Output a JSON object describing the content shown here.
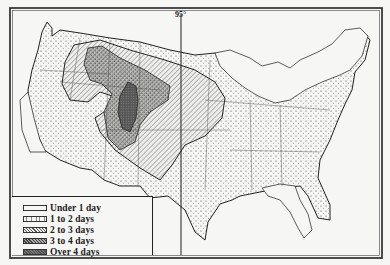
{
  "map": {
    "subject": "United States",
    "meridian_label": "95°",
    "legend": {
      "items": [
        {
          "label": "Under 1 day",
          "pattern": "blank"
        },
        {
          "label": "1 to 2 days",
          "pattern": "sparse-dots"
        },
        {
          "label": "2 to 3 days",
          "pattern": "diagonal-hatch"
        },
        {
          "label": "3 to 4 days",
          "pattern": "dense-stipple"
        },
        {
          "label": "Over 4 days",
          "pattern": "dark-fill"
        }
      ]
    },
    "colors": {
      "paper": "#f6f6f4",
      "ink": "#222222"
    }
  }
}
